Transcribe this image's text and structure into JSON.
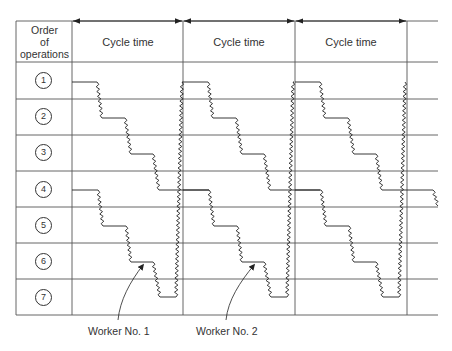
{
  "header": {
    "order_label": "Order of operations",
    "order_lines": [
      "Order",
      "of",
      "operations"
    ],
    "cycle_labels": [
      "Cycle time",
      "Cycle time",
      "Cycle time"
    ]
  },
  "operations": [
    "1",
    "2",
    "3",
    "4",
    "5",
    "6",
    "7"
  ],
  "workers": [
    {
      "label": "Worker No. 1"
    },
    {
      "label": "Worker No. 2"
    }
  ],
  "colors": {
    "line": "#333333",
    "grid": "#555555",
    "background": "#ffffff"
  },
  "layout": {
    "cycle_columns_x": [
      72,
      183,
      295,
      407
    ],
    "row_lines_y": [
      21,
      62,
      99,
      135,
      171,
      207,
      243,
      279,
      315
    ],
    "step_levels_upper": [
      82,
      118,
      154,
      190
    ],
    "step_levels_lower": [
      190,
      226,
      262,
      297
    ]
  }
}
